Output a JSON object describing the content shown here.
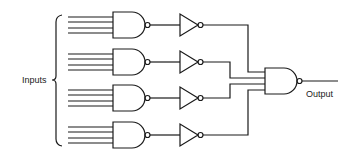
{
  "diagram": {
    "type": "logic-circuit",
    "labels": {
      "inputs": "Inputs",
      "output": "Output"
    },
    "stage1": {
      "gate_type": "NAND",
      "count": 4,
      "inputs_per_gate": 4
    },
    "stage2": {
      "gate_type": "NOT",
      "count": 4
    },
    "stage3": {
      "gate_type": "NAND",
      "count": 1,
      "inputs": 4
    },
    "colors": {
      "stroke": "#1a1a1a",
      "background": "#ffffff"
    }
  }
}
